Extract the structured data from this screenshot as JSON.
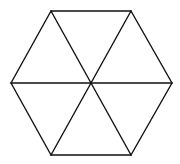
{
  "diagram": {
    "title": "",
    "shape": "regular hexagon divided into six equilateral triangles",
    "background": "#ffffff",
    "stroke_color": "#111111",
    "stroke_width": 1.4,
    "center": {
      "x": 91,
      "y": 83
    },
    "vertices": [
      {
        "name": "top-left",
        "x": 51,
        "y": 11
      },
      {
        "name": "top-right",
        "x": 131,
        "y": 11
      },
      {
        "name": "right",
        "x": 172,
        "y": 83
      },
      {
        "name": "bottom-right",
        "x": 131,
        "y": 155
      },
      {
        "name": "bottom-left",
        "x": 51,
        "y": 155
      },
      {
        "name": "left",
        "x": 11,
        "y": 83
      }
    ],
    "triangle_count": 6
  }
}
